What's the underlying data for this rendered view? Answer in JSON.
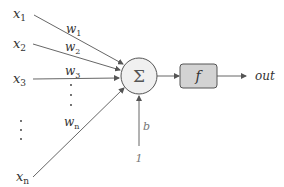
{
  "diagram": {
    "type": "perceptron",
    "inputs": [
      {
        "name": "x",
        "sub": "1",
        "weight": "w",
        "weight_sub": "1"
      },
      {
        "name": "x",
        "sub": "2",
        "weight": "w",
        "weight_sub": "2"
      },
      {
        "name": "x",
        "sub": "3",
        "weight": "w",
        "weight_sub": "3"
      },
      {
        "name": "x",
        "sub": "n",
        "weight": "w",
        "weight_sub": "n"
      }
    ],
    "sum_node": {
      "symbol": "Σ"
    },
    "activation": {
      "symbol": "f"
    },
    "output": {
      "label": "out"
    },
    "bias": {
      "weight": "b",
      "input": "1"
    },
    "ellipsis": "⋮",
    "colors": {
      "line": "#555555",
      "node_fill": "#f0f0f0",
      "node_stroke": "#555555",
      "box_fill": "#d3d3d3",
      "box_stroke": "#555555"
    }
  }
}
